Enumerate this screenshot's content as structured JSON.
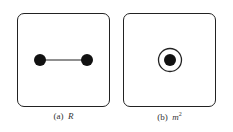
{
  "panels": [
    {
      "id": "a",
      "label_prefix": "(a)",
      "label_symbol": "R",
      "description": "two filled dots connected by a line"
    },
    {
      "id": "b",
      "label_prefix": "(b)",
      "label_symbol": "m",
      "label_superscript": "2",
      "description": "filled dot surrounded by a circle"
    }
  ]
}
